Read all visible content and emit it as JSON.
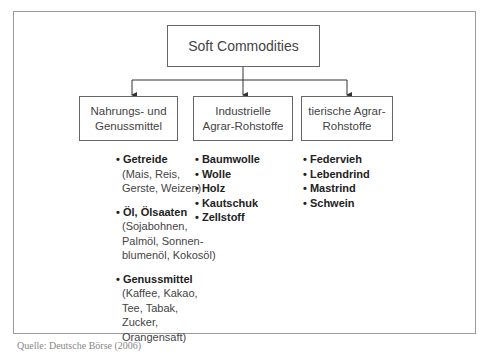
{
  "diagram": {
    "root": "Soft Commodities",
    "categories": [
      {
        "label_line1": "Nahrungs- und",
        "label_line2": "Genussmittel",
        "groups": [
          {
            "head": "Getreide",
            "lines": [
              "(Mais, Reis,",
              "Gerste, Weizen)"
            ]
          },
          {
            "head": "Öl, Ölsaaten",
            "lines": [
              "(Sojabohnen,",
              "Palmöl, Sonnen-",
              "blumenöl, Kokosöl)"
            ]
          },
          {
            "head": "Genussmittel",
            "lines": [
              "(Kaffee, Kakao,",
              "Tee, Tabak,",
              "Zucker,",
              "Orangensaft)"
            ]
          }
        ]
      },
      {
        "label_line1": "Industrielle",
        "label_line2": "Agrar-Rohstoffe",
        "items": [
          "Baumwolle",
          "Wolle",
          "Holz",
          "Kautschuk",
          "Zellstoff"
        ]
      },
      {
        "label_line1": "tierische Agrar-",
        "label_line2": "Rohstoffe",
        "items": [
          "Federvieh",
          "Lebendrind",
          "Mastrind",
          "Schwein"
        ]
      }
    ],
    "bullet": "•"
  },
  "caption": "Quelle: Deutsche Börse (2006)",
  "colors": {
    "line": "#333333",
    "frame": "#9a9a9a"
  }
}
